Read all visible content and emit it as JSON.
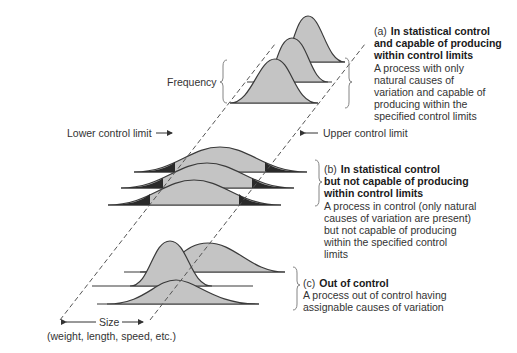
{
  "labels": {
    "frequency": "Frequency",
    "lower_control_limit": "Lower control limit",
    "upper_control_limit": "Upper control limit",
    "size_axis": "Size",
    "size_axis_sub": "(weight, length, speed, etc.)"
  },
  "panels": [
    {
      "tag": "(a)",
      "title_line1": "In statistical control",
      "title_line2": "and capable of producing",
      "title_line3": "within control limits",
      "desc_lines": [
        "A process with only",
        "natural causes of",
        "variation and capable of",
        "producing within the",
        "specified control limits"
      ]
    },
    {
      "tag": "(b)",
      "title_line1": "In statistical control",
      "title_line2": "but not capable of producing",
      "title_line3": "within control limits",
      "desc_lines": [
        "A process in control (only natural",
        "causes of variation are present)",
        "but not capable of producing",
        "within the specified control",
        "limits"
      ]
    },
    {
      "tag": "(c)",
      "title_line1": "Out of control",
      "desc_lines": [
        "A process out of control having",
        "assignable causes of variation"
      ]
    }
  ],
  "colors": {
    "curve_fill": "#c4c4c4",
    "curve_stroke": "#3a3a3a",
    "tail_fill": "#2a2a2a",
    "dashed_line": "#555555"
  }
}
